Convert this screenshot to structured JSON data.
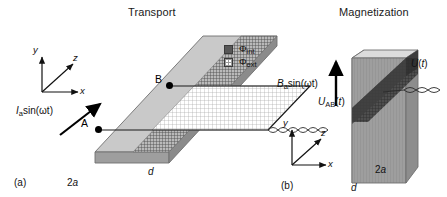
{
  "figure": {
    "panel_a": {
      "tag": "(a)",
      "title": "Transport",
      "axes": {
        "x": "x",
        "y": "y",
        "z": "z"
      },
      "drive_label": "I",
      "drive_sub": "a",
      "drive_rest": "sin(ωt)",
      "point_a": "A",
      "point_b": "B",
      "voltage_label": "U",
      "voltage_sub": "AB",
      "voltage_rest": "(t)",
      "thickness_label": "d",
      "width_label": "2a",
      "legend": [
        {
          "name": "flux-internal",
          "symbol": "Φ",
          "sub": "int",
          "swatch": "sw-int"
        },
        {
          "name": "flux-external",
          "symbol": "Φ",
          "sub": "ext",
          "swatch": "sw-ext"
        }
      ]
    },
    "panel_b": {
      "tag": "(b)",
      "title": "Magnetization",
      "axes": {
        "x": "x",
        "y": "y",
        "z": "z"
      },
      "drive_label": "B",
      "drive_sub": "a",
      "drive_rest": "sin(ωt)",
      "voltage_label": "U",
      "voltage_rest": "(t)",
      "thickness_label": "d",
      "width_label": "2a"
    }
  },
  "colors": {
    "slab_top": "#cfcfcf",
    "slab_front": "#9a9a9a",
    "slab_side": "#b5b5b5",
    "slab_dark": "#6a6a6a",
    "outline": "#6b6b6b",
    "text": "#111111",
    "mesh": "#9a9a9a"
  }
}
